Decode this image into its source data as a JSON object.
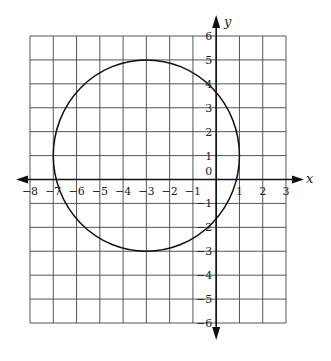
{
  "graph": {
    "x_axis_label": "x",
    "y_axis_label": "y",
    "x_range": [
      -8,
      3
    ],
    "y_range": [
      -6,
      6
    ],
    "x_tick_labels": [
      "-8",
      "-7",
      "-6",
      "-5",
      "-4",
      "-3",
      "-2",
      "-1",
      "1",
      "2",
      "3"
    ],
    "y_tick_labels": [
      "6",
      "5",
      "4",
      "3",
      "2",
      "1",
      "0",
      "-1",
      "-2",
      "-3",
      "-4",
      "-5",
      "-6"
    ],
    "origin_label": "0",
    "grid": true
  },
  "shapes": [
    {
      "type": "circle",
      "center": [
        -3,
        1
      ],
      "radius": 4
    }
  ],
  "colors": {
    "grid": "#555555",
    "axis": "#111111",
    "curve": "#111111",
    "background": "#ffffff"
  }
}
